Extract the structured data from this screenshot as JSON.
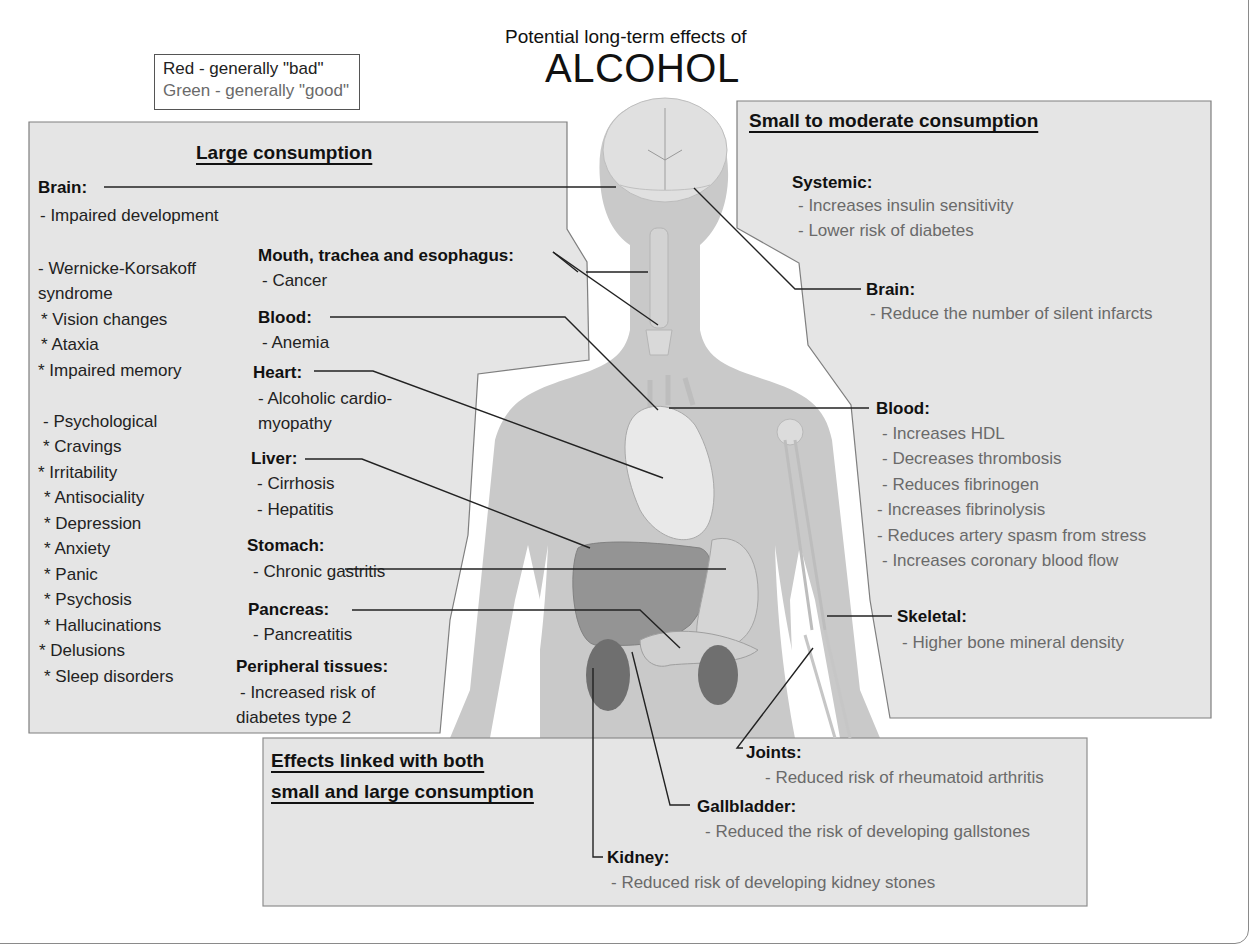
{
  "header": {
    "subtitle": "Potential long-term effects of",
    "title": "ALCOHOL"
  },
  "legend": {
    "red_label": "Red - generally \"bad\"",
    "green_label": "Green - generally \"good\""
  },
  "colors": {
    "bad_text": "#222222",
    "good_text": "#6a6a6a",
    "panel_fill": "#e4e4e4",
    "body_fill": "#c9c9c9"
  },
  "large_consumption": {
    "title": "Large consumption",
    "brain": {
      "heading": "Brain:",
      "items": [
        "- Impaired development",
        "- Wernicke-Korsakoff",
        "syndrome",
        "* Vision changes",
        "* Ataxia",
        "* Impaired memory",
        "- Psychological",
        "* Cravings",
        "* Irritability",
        "* Antisociality",
        "* Depression",
        "* Anxiety",
        "* Panic",
        "* Psychosis",
        "* Hallucinations",
        "* Delusions",
        "* Sleep disorders"
      ]
    },
    "mouth": {
      "heading": "Mouth, trachea and esophagus:",
      "items": [
        "- Cancer"
      ]
    },
    "blood": {
      "heading": "Blood:",
      "items": [
        "- Anemia"
      ]
    },
    "heart": {
      "heading": "Heart:",
      "items": [
        "- Alcoholic cardio-",
        "myopathy"
      ]
    },
    "liver": {
      "heading": "Liver:",
      "items": [
        "- Cirrhosis",
        "- Hepatitis"
      ]
    },
    "stomach": {
      "heading": "Stomach:",
      "items": [
        "- Chronic gastritis"
      ]
    },
    "pancreas": {
      "heading": "Pancreas:",
      "items": [
        "- Pancreatitis"
      ]
    },
    "peripheral": {
      "heading": "Peripheral tissues:",
      "items": [
        "- Increased risk of",
        "diabetes type 2"
      ]
    }
  },
  "small_consumption": {
    "title": "Small to moderate consumption",
    "systemic": {
      "heading": "Systemic:",
      "items": [
        "- Increases insulin sensitivity",
        "- Lower risk of diabetes"
      ]
    },
    "brain": {
      "heading": "Brain:",
      "items": [
        "- Reduce the number of silent infarcts"
      ]
    },
    "blood": {
      "heading": "Blood:",
      "items": [
        "- Increases HDL",
        "- Decreases thrombosis",
        "- Reduces fibrinogen",
        "- Increases fibrinolysis",
        "- Reduces artery spasm from stress",
        "- Increases coronary blood flow"
      ]
    },
    "skeletal": {
      "heading": "Skeletal:",
      "items": [
        "- Higher bone mineral density"
      ]
    }
  },
  "both_consumption": {
    "title_line1": "Effects linked with both",
    "title_line2": "small and large consumption",
    "joints": {
      "heading": "Joints:",
      "items": [
        "- Reduced risk of rheumatoid arthritis"
      ]
    },
    "gallbladder": {
      "heading": "Gallbladder:",
      "items": [
        "- Reduced the risk of developing gallstones"
      ]
    },
    "kidney": {
      "heading": "Kidney:",
      "items": [
        "- Reduced risk of developing kidney stones"
      ]
    }
  }
}
